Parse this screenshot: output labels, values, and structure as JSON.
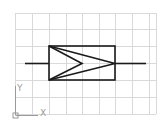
{
  "drawing": {
    "view": "cad-model-space",
    "grid": {
      "color": "#d9d9d9",
      "x_lines": [
        15,
        32,
        49,
        66,
        82,
        99,
        115,
        132,
        149,
        156
      ],
      "y_lines": [
        13,
        29,
        46,
        63,
        80,
        97,
        114
      ]
    },
    "symbol": {
      "name": "rectangle-with-chevron",
      "stroke": "#1a1a1a",
      "rect": {
        "x": 49,
        "y": 46,
        "w": 66,
        "h": 34
      },
      "lead_left": {
        "x1": 25,
        "y1": 63,
        "x2": 49,
        "y2": 63
      },
      "lead_right": {
        "x1": 115,
        "y1": 63,
        "x2": 146,
        "y2": 63
      }
    },
    "ucs": {
      "x_label": "X",
      "y_label": "Y",
      "color": "#9a9a9a"
    }
  }
}
